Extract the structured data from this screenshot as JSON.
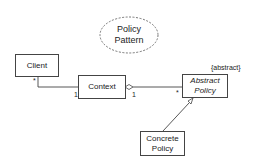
{
  "diagram": {
    "type": "UML class diagram",
    "title": {
      "line1": "Policy",
      "line2": "Pattern",
      "shape": "dashed-ellipse"
    },
    "classes": [
      {
        "id": "client",
        "name": "Client"
      },
      {
        "id": "context",
        "name": "Context"
      },
      {
        "id": "abstract_policy",
        "name_line1": "Abstract",
        "name_line2": "Policy",
        "stereotype": "{abstract}"
      },
      {
        "id": "concrete_policy",
        "name_line1": "Concrete",
        "name_line2": "Policy"
      }
    ],
    "relations": [
      {
        "from": "client",
        "to": "context",
        "kind": "association",
        "from_mult": "*",
        "to_mult": "1"
      },
      {
        "from": "context",
        "to": "abstract_policy",
        "kind": "aggregation",
        "from_mult": "1",
        "to_mult": "*"
      },
      {
        "from": "concrete_policy",
        "to": "abstract_policy",
        "kind": "generalization"
      }
    ],
    "labels": {
      "client_mult": "*",
      "context_mult_left": "1",
      "context_mult_right": "1",
      "abstract_mult": "*",
      "stereotype": "{abstract}"
    }
  }
}
